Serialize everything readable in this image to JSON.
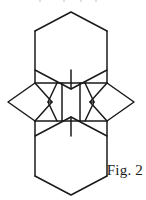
{
  "figure": {
    "caption": "Fig. 2",
    "label": "hexagonal-rhombus-tiling",
    "stroke_color": "#1a1a1a",
    "fill_color": "#ffffff",
    "background_color": "#ffffff",
    "canvas": {
      "width": 146,
      "height": 200
    },
    "geometry": {
      "unit": "px",
      "top_hexagon": "M 71 12 L 107 31 L 107 70 L 71 89 L 35 70 L 35 31 Z",
      "bottom_hexagon": "M 71 117 L 107 136 L 107 176 L 71 195 L 35 176 L 35 136 Z",
      "left_rhombus": "M 8 102 L 30 83 L 52 102 L 30 121 Z",
      "right_rhombus": "M 110 102 L 88 83 L 66 102 L 88 121 Z",
      "center_hexagon": "M 59 83 L 81 83 L 92 102 L 81 121 L 59 121 L 48 102 Z",
      "outline": "M 71 12 L 107 31 L 107 70 L 88 83 L 110 102 L 88 121 L 107 136 L 107 176 L 71 195 L 35 176 L 35 136 L 52 121 L 30 121 L 8 102 L 30 83 L 52 83 L 35 70 L 35 31 Z"
    },
    "segments": [
      {
        "name": "outline-top-left-up",
        "x1": 35,
        "y1": 31,
        "x2": 71,
        "y2": 12
      },
      {
        "name": "outline-top-right-up",
        "x1": 71,
        "y1": 12,
        "x2": 107,
        "y2": 31
      },
      {
        "name": "outline-left-upper",
        "x1": 35,
        "y1": 31,
        "x2": 35,
        "y2": 70
      },
      {
        "name": "outline-right-upper",
        "x1": 107,
        "y1": 31,
        "x2": 107,
        "y2": 70
      },
      {
        "name": "hex-top-bottom-left",
        "x1": 35,
        "y1": 70,
        "x2": 57,
        "y2": 83
      },
      {
        "name": "hex-top-bottom-right",
        "x1": 107,
        "y1": 70,
        "x2": 85,
        "y2": 83
      },
      {
        "name": "hex-top-lower-v-left",
        "x1": 57,
        "y1": 83,
        "x2": 71,
        "y2": 70
      },
      {
        "name": "hex-top-lower-v-right",
        "x1": 71,
        "y1": 70,
        "x2": 85,
        "y2": 83
      },
      {
        "name": "center-row-top-edge-left",
        "x1": 35,
        "y1": 83,
        "x2": 57,
        "y2": 83
      },
      {
        "name": "center-row-top-edge-mid",
        "x1": 57,
        "y1": 83,
        "x2": 85,
        "y2": 83
      },
      {
        "name": "left-rhombus-upper",
        "x1": 8,
        "y1": 102,
        "x2": 30,
        "y2": 83
      },
      {
        "name": "left-rhombus-lower",
        "x1": 8,
        "y1": 102,
        "x2": 30,
        "y2": 121
      },
      {
        "name": "right-rhombus-upper",
        "x1": 110,
        "y1": 102,
        "x2": 88,
        "y2": 83
      },
      {
        "name": "right-rhombus-lower",
        "x1": 110,
        "y1": 102,
        "x2": 88,
        "y2": 121
      },
      {
        "name": "center-band-bottom",
        "x1": 35,
        "y1": 121,
        "x2": 85,
        "y2": 121
      },
      {
        "name": "hex-bottom-top-left",
        "x1": 35,
        "y1": 136,
        "x2": 57,
        "y2": 121
      },
      {
        "name": "hex-bottom-top-right",
        "x1": 107,
        "y1": 136,
        "x2": 85,
        "y2": 121
      },
      {
        "name": "hex-bottom-upper-v-left",
        "x1": 57,
        "y1": 121,
        "x2": 71,
        "y2": 136
      },
      {
        "name": "hex-bottom-upper-v-right",
        "x1": 71,
        "y1": 136,
        "x2": 85,
        "y2": 121
      },
      {
        "name": "outline-left-lower",
        "x1": 35,
        "y1": 136,
        "x2": 35,
        "y2": 176
      },
      {
        "name": "outline-right-lower",
        "x1": 107,
        "y1": 136,
        "x2": 107,
        "y2": 176
      },
      {
        "name": "outline-bottom-left-down",
        "x1": 35,
        "y1": 176,
        "x2": 71,
        "y2": 195
      },
      {
        "name": "outline-bottom-right-down",
        "x1": 71,
        "y1": 195,
        "x2": 107,
        "y2": 176
      },
      {
        "name": "vert-inner-left-upper",
        "x1": 57,
        "y1": 83,
        "x2": 57,
        "y2": 102
      },
      {
        "name": "vert-inner-right-upper",
        "x1": 85,
        "y1": 83,
        "x2": 85,
        "y2": 102
      },
      {
        "name": "vert-inner-left-lower",
        "x1": 57,
        "y1": 102,
        "x2": 57,
        "y2": 121
      },
      {
        "name": "vert-inner-right-lower",
        "x1": 85,
        "y1": 102,
        "x2": 85,
        "y2": 121
      },
      {
        "name": "vert-outer-left-upper",
        "x1": 35,
        "y1": 70,
        "x2": 35,
        "y2": 83
      },
      {
        "name": "vert-outer-right-upper",
        "x1": 107,
        "y1": 70,
        "x2": 107,
        "y2": 83
      },
      {
        "name": "vert-outer-left-lower",
        "x1": 35,
        "y1": 121,
        "x2": 35,
        "y2": 136
      },
      {
        "name": "vert-outer-right-lower",
        "x1": 107,
        "y1": 121,
        "x2": 107,
        "y2": 136
      },
      {
        "name": "rhombus-left-to-hexL-up",
        "x1": 30,
        "y1": 83,
        "x2": 48,
        "y2": 102
      },
      {
        "name": "rhombus-left-to-hexL-dn",
        "x1": 48,
        "y1": 102,
        "x2": 30,
        "y2": 121
      },
      {
        "name": "rhombus-right-to-hexR-up",
        "x1": 88,
        "y1": 83,
        "x2": 70,
        "y2": 102
      },
      {
        "name": "rhombus-right-to-hexR-dn",
        "x1": 70,
        "y1": 102,
        "x2": 88,
        "y2": 121
      }
    ]
  }
}
